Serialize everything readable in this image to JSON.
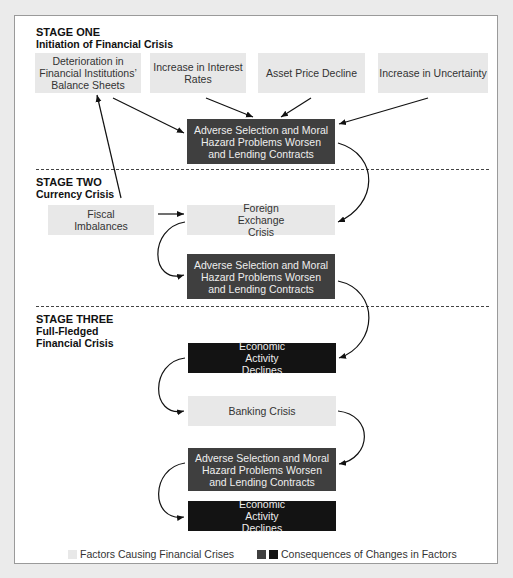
{
  "stages": [
    {
      "title": "STAGE ONE",
      "subtitle": "Initiation of Financial Crisis"
    },
    {
      "title": "STAGE TWO",
      "subtitle": "Currency Crisis"
    },
    {
      "title": "STAGE THREE",
      "subtitle_line1": "Full-Fledged",
      "subtitle_line2": "Financial Crisis"
    }
  ],
  "boxes": {
    "deterioration": "Deterioration in Financial Institutions’ Balance Sheets",
    "interest": "Increase in Interest Rates",
    "asset": "Asset Price Decline",
    "uncertainty": "Increase in Uncertainty",
    "adverse1": "Adverse Selection and Moral Hazard Problems Worsen and Lending Contracts",
    "fiscal": "Fiscal Imbalances",
    "forex": "Foreign Exchange Crisis",
    "adverse2": "Adverse Selection and Moral Hazard Problems Worsen and Lending Contracts",
    "econ1": "Economic Activity Declines",
    "banking": "Banking Crisis",
    "adverse3": "Adverse Selection and Moral Hazard Problems Worsen and Lending Contracts",
    "econ2": "Economic Activity Declines"
  },
  "legend": {
    "factors": "Factors Causing Financial Crises",
    "consequences": "Consequences of Changes in Factors"
  },
  "colors": {
    "factor": "#e8e8e8",
    "consequence": "#3f3f3f",
    "consequence_dark": "#131313"
  }
}
